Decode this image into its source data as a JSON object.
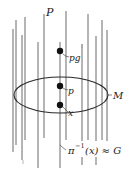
{
  "diagram": {
    "title_label": "P",
    "manifold_label": "M",
    "points": [
      {
        "label": "pg",
        "x": 60,
        "y": 51
      },
      {
        "label": "p",
        "x": 60,
        "y": 86
      },
      {
        "label": "x",
        "x": 60,
        "y": 105
      }
    ],
    "fiber_caption": "π⁻¹(x) ≈ G",
    "fiber_caption_parts": {
      "pi": "π",
      "sup": "−1",
      "arg": "(x) ≈ G"
    },
    "colors": {
      "fiber": "#5a5a5a",
      "ellipse": "#2a2a2a",
      "point": "#111111",
      "background": "#ffffff"
    }
  }
}
